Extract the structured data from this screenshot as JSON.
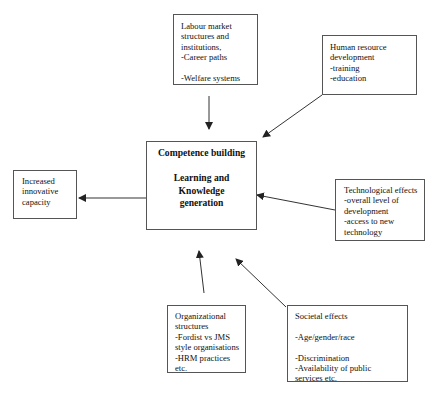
{
  "diagram": {
    "central": {
      "lines": [
        "Competence building",
        "",
        "Learning and",
        "Knowledge",
        "generation"
      ]
    },
    "output": {
      "lines": [
        "Increased",
        "innovative",
        "capacity"
      ]
    },
    "inputs": {
      "labour_market": {
        "lines": [
          "Labour market",
          "structures and",
          "institutions,",
          "-Career paths",
          "",
          "-Welfare systems"
        ]
      },
      "human_resource": {
        "lines": [
          "Human resource",
          "development",
          "-training",
          "-education"
        ]
      },
      "technological": {
        "lines": [
          "Technological effects",
          "-overall level of",
          "development",
          "-access to new",
          "technology"
        ]
      },
      "organizational": {
        "lines": [
          "Organizational",
          "structures",
          "-Fordist vs JMS",
          "style organisations",
          "-HRM practices",
          "etc."
        ]
      },
      "societal": {
        "lines": [
          "Societal effects",
          "",
          "-Age/gender/race",
          "",
          "-Discrimination",
          "-Availability of public",
          "services etc."
        ]
      }
    },
    "colors": {
      "line": "#333333",
      "border": "#555555",
      "text": "#111111",
      "background": "#ffffff"
    }
  }
}
